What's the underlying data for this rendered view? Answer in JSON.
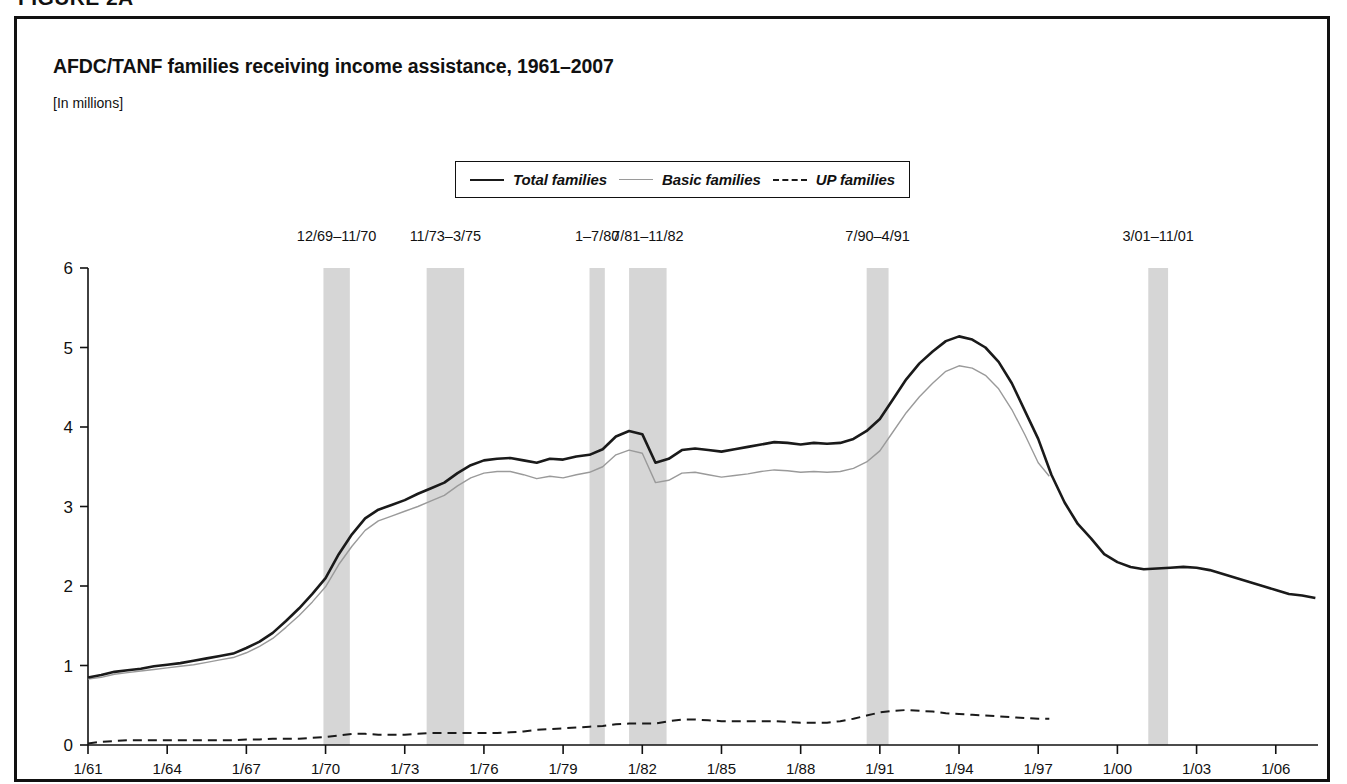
{
  "figure": {
    "label": "FIGURE 2A"
  },
  "chart_header": {
    "title": "AFDC/TANF families receiving income assistance, 1961–2007",
    "units": "[In millions]"
  },
  "legend": {
    "position": "top-center",
    "entries": [
      {
        "label": "Total families",
        "style": "solid",
        "color": "#1a1a1a",
        "icon": "solid-line-icon"
      },
      {
        "label": "Basic families",
        "style": "solid-thin",
        "color": "#9a9a9a",
        "icon": "thin-line-icon"
      },
      {
        "label": "UP families",
        "style": "dashed",
        "color": "#1a1a1a",
        "icon": "dashed-line-icon"
      }
    ]
  },
  "colors": {
    "total": "#1a1a1a",
    "basic": "#9a9a9a",
    "up": "#1a1a1a",
    "recession_band": "#d6d6d6",
    "axis": "#111111",
    "frame": "#111111"
  },
  "chart_data": {
    "type": "line",
    "title": "AFDC/TANF families receiving income assistance, 1961–2007",
    "xlabel": "",
    "ylabel": "",
    "units": "millions",
    "grid": false,
    "legend_position": "top-center",
    "xlim": [
      1961.0,
      2007.6
    ],
    "ylim": [
      0,
      6
    ],
    "yticks": [
      0,
      1,
      2,
      3,
      4,
      5,
      6
    ],
    "ytick_labels": [
      "0",
      "1",
      "2",
      "3",
      "4",
      "5",
      "6"
    ],
    "xticks": [
      1961,
      1964,
      1967,
      1970,
      1973,
      1976,
      1979,
      1982,
      1985,
      1988,
      1991,
      1994,
      1997,
      2000,
      2003,
      2006
    ],
    "xtick_labels": [
      "1/61",
      "1/64",
      "1/67",
      "1/70",
      "1/73",
      "1/76",
      "1/79",
      "1/82",
      "1/85",
      "1/88",
      "1/91",
      "1/94",
      "1/97",
      "1/00",
      "1/03",
      "1/06"
    ],
    "recession_bands": [
      {
        "label": "12/69–11/70",
        "start": 1969.92,
        "end": 1970.92
      },
      {
        "label": "11/73–3/75",
        "start": 1973.83,
        "end": 1975.25
      },
      {
        "label": "1–7/80",
        "start": 1980.0,
        "end": 1980.58
      },
      {
        "label": "7/81–11/82",
        "start": 1981.5,
        "end": 1982.92
      },
      {
        "label": "7/90–4/91",
        "start": 1990.5,
        "end": 1991.33
      },
      {
        "label": "3/01–11/01",
        "start": 2001.17,
        "end": 2001.92
      }
    ],
    "series": [
      {
        "name": "Total families",
        "style": "solid",
        "color": "#1a1a1a",
        "x": [
          1961.0,
          1961.5,
          1962.0,
          1962.5,
          1963.0,
          1963.5,
          1964.0,
          1964.5,
          1965.0,
          1965.5,
          1966.0,
          1966.5,
          1967.0,
          1967.5,
          1968.0,
          1968.5,
          1969.0,
          1969.5,
          1970.0,
          1970.5,
          1971.0,
          1971.5,
          1972.0,
          1972.5,
          1973.0,
          1973.5,
          1974.0,
          1974.5,
          1975.0,
          1975.5,
          1976.0,
          1976.5,
          1977.0,
          1977.5,
          1978.0,
          1978.5,
          1979.0,
          1979.5,
          1980.0,
          1980.5,
          1981.0,
          1981.5,
          1982.0,
          1982.5,
          1983.0,
          1983.5,
          1984.0,
          1984.5,
          1985.0,
          1985.5,
          1986.0,
          1986.5,
          1987.0,
          1987.5,
          1988.0,
          1988.5,
          1989.0,
          1989.5,
          1990.0,
          1990.5,
          1991.0,
          1991.5,
          1992.0,
          1992.5,
          1993.0,
          1993.5,
          1994.0,
          1994.5,
          1995.0,
          1995.5,
          1996.0,
          1996.5,
          1997.0,
          1997.5,
          1998.0,
          1998.5,
          1999.0,
          1999.5,
          2000.0,
          2000.5,
          2001.0,
          2001.5,
          2002.0,
          2002.5,
          2003.0,
          2003.5,
          2004.0,
          2004.5,
          2005.0,
          2005.5,
          2006.0,
          2006.5,
          2007.0,
          2007.5
        ],
        "y": [
          0.85,
          0.88,
          0.92,
          0.94,
          0.96,
          0.99,
          1.01,
          1.03,
          1.06,
          1.09,
          1.12,
          1.15,
          1.22,
          1.3,
          1.41,
          1.56,
          1.72,
          1.9,
          2.1,
          2.4,
          2.65,
          2.85,
          2.96,
          3.02,
          3.08,
          3.16,
          3.23,
          3.3,
          3.42,
          3.52,
          3.58,
          3.6,
          3.61,
          3.58,
          3.55,
          3.6,
          3.59,
          3.63,
          3.65,
          3.72,
          3.88,
          3.95,
          3.91,
          3.55,
          3.6,
          3.71,
          3.73,
          3.71,
          3.69,
          3.72,
          3.75,
          3.78,
          3.81,
          3.8,
          3.78,
          3.8,
          3.79,
          3.8,
          3.85,
          3.95,
          4.1,
          4.35,
          4.6,
          4.8,
          4.95,
          5.08,
          5.14,
          5.1,
          5.0,
          4.82,
          4.55,
          4.2,
          3.85,
          3.4,
          3.05,
          2.78,
          2.6,
          2.4,
          2.3,
          2.24,
          2.21,
          2.22,
          2.23,
          2.24,
          2.23,
          2.2,
          2.15,
          2.1,
          2.05,
          2.0,
          1.95,
          1.9,
          1.88,
          1.85
        ]
      },
      {
        "name": "Basic families",
        "style": "solid-thin",
        "color": "#9a9a9a",
        "x": [
          1961.0,
          1961.5,
          1962.0,
          1962.5,
          1963.0,
          1963.5,
          1964.0,
          1964.5,
          1965.0,
          1965.5,
          1966.0,
          1966.5,
          1967.0,
          1967.5,
          1968.0,
          1968.5,
          1969.0,
          1969.5,
          1970.0,
          1970.5,
          1971.0,
          1971.5,
          1972.0,
          1972.5,
          1973.0,
          1973.5,
          1974.0,
          1974.5,
          1975.0,
          1975.5,
          1976.0,
          1976.5,
          1977.0,
          1977.5,
          1978.0,
          1978.5,
          1979.0,
          1979.5,
          1980.0,
          1980.5,
          1981.0,
          1981.5,
          1982.0,
          1982.5,
          1983.0,
          1983.5,
          1984.0,
          1984.5,
          1985.0,
          1985.5,
          1986.0,
          1986.5,
          1987.0,
          1987.5,
          1988.0,
          1988.5,
          1989.0,
          1989.5,
          1990.0,
          1990.5,
          1991.0,
          1991.5,
          1992.0,
          1992.5,
          1993.0,
          1993.5,
          1994.0,
          1994.5,
          1995.0,
          1995.5,
          1996.0,
          1996.5,
          1997.0,
          1997.42
        ],
        "y": [
          0.83,
          0.85,
          0.89,
          0.91,
          0.93,
          0.95,
          0.97,
          0.99,
          1.01,
          1.04,
          1.07,
          1.1,
          1.16,
          1.24,
          1.34,
          1.48,
          1.63,
          1.8,
          1.99,
          2.27,
          2.5,
          2.7,
          2.82,
          2.88,
          2.94,
          3.0,
          3.07,
          3.14,
          3.26,
          3.36,
          3.42,
          3.44,
          3.44,
          3.4,
          3.35,
          3.38,
          3.36,
          3.4,
          3.43,
          3.5,
          3.65,
          3.71,
          3.67,
          3.3,
          3.33,
          3.42,
          3.43,
          3.4,
          3.37,
          3.39,
          3.41,
          3.44,
          3.46,
          3.45,
          3.43,
          3.44,
          3.43,
          3.44,
          3.48,
          3.56,
          3.7,
          3.94,
          4.18,
          4.38,
          4.55,
          4.7,
          4.77,
          4.74,
          4.65,
          4.48,
          4.22,
          3.9,
          3.55,
          3.38
        ]
      },
      {
        "name": "UP families",
        "style": "dashed",
        "color": "#1a1a1a",
        "x": [
          1961.0,
          1961.5,
          1962.0,
          1962.5,
          1963.0,
          1963.5,
          1964.0,
          1964.5,
          1965.0,
          1965.5,
          1966.0,
          1966.5,
          1967.0,
          1967.5,
          1968.0,
          1968.5,
          1969.0,
          1969.5,
          1970.0,
          1970.5,
          1971.0,
          1971.5,
          1972.0,
          1972.5,
          1973.0,
          1973.5,
          1974.0,
          1974.5,
          1975.0,
          1975.5,
          1976.0,
          1976.5,
          1977.0,
          1977.5,
          1978.0,
          1978.5,
          1979.0,
          1979.5,
          1980.0,
          1980.5,
          1981.0,
          1981.5,
          1982.0,
          1982.5,
          1983.0,
          1983.5,
          1984.0,
          1984.5,
          1985.0,
          1985.5,
          1986.0,
          1986.5,
          1987.0,
          1987.5,
          1988.0,
          1988.5,
          1989.0,
          1989.5,
          1990.0,
          1990.5,
          1991.0,
          1991.5,
          1992.0,
          1992.5,
          1993.0,
          1993.5,
          1994.0,
          1994.5,
          1995.0,
          1995.5,
          1996.0,
          1996.5,
          1997.0,
          1997.42
        ],
        "y": [
          0.02,
          0.04,
          0.05,
          0.06,
          0.06,
          0.06,
          0.06,
          0.06,
          0.06,
          0.06,
          0.06,
          0.06,
          0.07,
          0.07,
          0.08,
          0.08,
          0.08,
          0.09,
          0.1,
          0.12,
          0.14,
          0.14,
          0.13,
          0.13,
          0.13,
          0.14,
          0.15,
          0.15,
          0.15,
          0.15,
          0.15,
          0.15,
          0.16,
          0.17,
          0.19,
          0.2,
          0.21,
          0.22,
          0.23,
          0.24,
          0.26,
          0.27,
          0.27,
          0.27,
          0.3,
          0.32,
          0.32,
          0.31,
          0.3,
          0.3,
          0.3,
          0.3,
          0.3,
          0.29,
          0.28,
          0.28,
          0.28,
          0.3,
          0.33,
          0.37,
          0.41,
          0.43,
          0.44,
          0.43,
          0.42,
          0.4,
          0.39,
          0.38,
          0.37,
          0.36,
          0.35,
          0.34,
          0.33,
          0.33
        ]
      }
    ]
  }
}
